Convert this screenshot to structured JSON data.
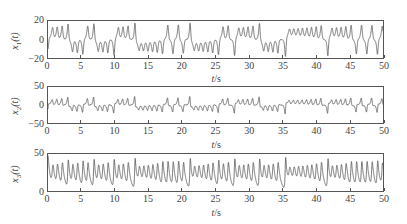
{
  "chart_data": [
    {
      "type": "line",
      "title": "",
      "series_name": "x1(t)",
      "ylabel_var": "x",
      "ylabel_sub": "1",
      "ylabel_arg": "(t)",
      "xlabel_var": "t",
      "xlabel_unit": "/s",
      "xlim": [
        0,
        50
      ],
      "ylim": [
        -20,
        20
      ],
      "xticks": [
        0,
        5,
        10,
        15,
        20,
        25,
        30,
        35,
        40,
        45,
        50
      ],
      "yticks": [
        20,
        0,
        -20
      ],
      "ytick_labels": [
        "20",
        "0",
        "−20"
      ],
      "grid": false,
      "description": "Chaotic Lorenz x1 trajectory: small oscillations near -10 until t≈7.5, then irregular switching between lobes with peaks up to ~17"
    },
    {
      "type": "line",
      "title": "",
      "series_name": "x2(t)",
      "ylabel_var": "x",
      "ylabel_sub": "2",
      "ylabel_arg": "(t)",
      "xlabel_var": "t",
      "xlabel_unit": "/s",
      "xlim": [
        0,
        50
      ],
      "ylim": [
        -50,
        50
      ],
      "xticks": [
        0,
        5,
        10,
        15,
        20,
        25,
        30,
        35,
        40,
        45,
        50
      ],
      "yticks": [
        50,
        0,
        -50
      ],
      "ytick_labels": [
        "50",
        "0",
        "−50"
      ],
      "grid": false,
      "description": "Chaotic Lorenz x2 trajectory: small oscillations around -10, bursts up to ~±25"
    },
    {
      "type": "line",
      "title": "",
      "series_name": "x3(t)",
      "ylabel_var": "x",
      "ylabel_sub": "3",
      "ylabel_arg": "(t)",
      "xlabel_var": "t",
      "xlabel_unit": "/s",
      "xlim": [
        0,
        50
      ],
      "ylim": [
        0,
        50
      ],
      "xticks": [
        0,
        5,
        10,
        15,
        20,
        25,
        30,
        35,
        40,
        45,
        50
      ],
      "yticks": [
        50,
        0
      ],
      "ytick_labels": [
        "50",
        "0"
      ],
      "grid": false,
      "description": "Chaotic Lorenz x3 trajectory: oscillation centered ~27 growing in amplitude, range ~5 to ~45, initial spike near 45 at t=0"
    }
  ],
  "system": {
    "sigma": 10,
    "rho": 28,
    "beta": 2.6667,
    "initial": [
      -10.2,
      -10.5,
      48
    ],
    "dt": 0.005,
    "t_end": 50
  },
  "layout": {
    "panels": [
      {
        "frame_left": 47,
        "frame_top": 20,
        "frame_width": 337,
        "frame_height": 39,
        "xlabel_top": 73
      },
      {
        "frame_left": 47,
        "frame_top": 86,
        "frame_width": 337,
        "frame_height": 38,
        "xlabel_top": 139
      },
      {
        "frame_left": 47,
        "frame_top": 153,
        "frame_width": 337,
        "frame_height": 39,
        "xlabel_top": 207
      }
    ],
    "line_color": "#555555"
  }
}
